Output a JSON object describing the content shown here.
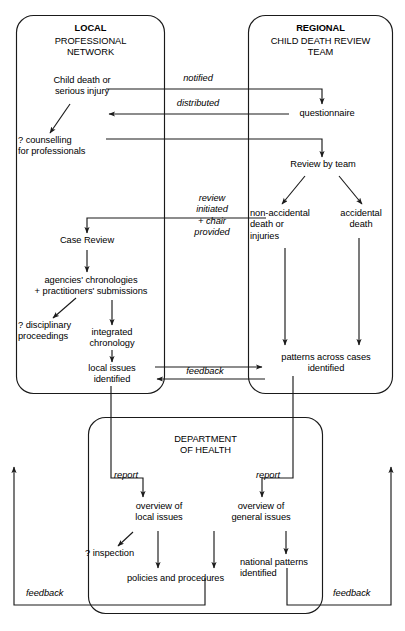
{
  "diagram": {
    "stroke_color": "#1a1a1a",
    "background_color": "#ffffff",
    "groups": [
      {
        "id": "local",
        "title_bold": "LOCAL",
        "title_rest": "PROFESSIONAL\nNETWORK"
      },
      {
        "id": "regional",
        "title_bold": "REGIONAL",
        "title_rest": "CHILD DEATH REVIEW\nTEAM"
      },
      {
        "id": "doh",
        "title_bold": "",
        "title_rest": "DEPARTMENT\nOF HEALTH"
      }
    ],
    "nodes": {
      "child_death": "Child death or\nserious injury",
      "counselling": "? counselling\nfor professionals",
      "case_review": "Case Review",
      "agencies": "agencies' chronologies\n+ practitioners' submissions",
      "disciplinary": "? disciplinary\nproceedings",
      "integrated": "integrated\nchronology",
      "local_issues": "local issues\nidentified",
      "questionnaire": "questionnaire",
      "review_by_team": "Review by team",
      "non_accidental": "non-accidental\ndeath or\ninjuries",
      "accidental": "accidental\ndeath",
      "patterns": "patterns across cases\nidentified",
      "overview_local": "overview of\nlocal issues",
      "overview_general": "overview of\ngeneral issues",
      "inspection": "? inspection",
      "policies": "policies and procedures",
      "national_patterns": "national patterns\nidentified"
    },
    "edge_labels": {
      "notified": "notified",
      "distributed": "distributed",
      "review_initiated": "review\ninitiated\n+ chair\nprovided",
      "feedback_mid": "feedback",
      "report_left": "report",
      "report_right": "report",
      "feedback_left": "feedback",
      "feedback_right": "feedback"
    }
  }
}
